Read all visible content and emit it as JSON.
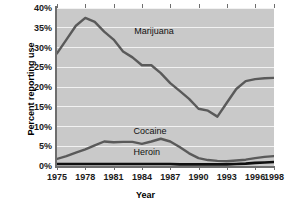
{
  "chart_data": {
    "type": "line",
    "title": "",
    "xlabel": "Year",
    "ylabel": "Percent reporting use",
    "xlim": [
      1975,
      1998
    ],
    "ylim": [
      0,
      40
    ],
    "grid": true,
    "legend_position": "inline-labels",
    "background_color": "#c9c9c9",
    "gridline_color": "#f2f2f2",
    "x_ticks": [
      1975,
      1978,
      1981,
      1984,
      1987,
      1990,
      1993,
      1996,
      1998
    ],
    "x_tick_labels": [
      "1975",
      "1978",
      "1981",
      "1984",
      "1987",
      "1990",
      "1993",
      "1996",
      "1998"
    ],
    "y_ticks": [
      0,
      5,
      10,
      15,
      20,
      25,
      30,
      35,
      40
    ],
    "y_tick_labels": [
      "0%",
      "5%",
      "10%",
      "15%",
      "20%",
      "25%",
      "30%",
      "35%",
      "40%"
    ],
    "x": [
      1975,
      1976,
      1977,
      1978,
      1979,
      1980,
      1981,
      1982,
      1983,
      1984,
      1985,
      1986,
      1987,
      1988,
      1989,
      1990,
      1991,
      1992,
      1993,
      1994,
      1995,
      1996,
      1997,
      1998
    ],
    "series": [
      {
        "name": "Marijuana",
        "color": "#5a5a5a",
        "label_x": 1983.2,
        "label_y": 34.0,
        "values": [
          28.5,
          32.0,
          35.5,
          37.5,
          36.5,
          34.0,
          32.0,
          29.0,
          27.5,
          25.5,
          25.5,
          23.5,
          21.0,
          19.0,
          17.0,
          14.5,
          14.0,
          12.5,
          16.0,
          19.5,
          21.5,
          22.0,
          22.2,
          22.3
        ]
      },
      {
        "name": "Cocaine",
        "color": "#5a5a5a",
        "label_x": 1983.1,
        "label_y": 8.6,
        "values": [
          1.8,
          2.5,
          3.4,
          4.2,
          5.2,
          6.2,
          6.0,
          6.1,
          6.1,
          5.6,
          6.2,
          6.9,
          6.2,
          4.8,
          3.2,
          2.0,
          1.5,
          1.3,
          1.2,
          1.4,
          1.6,
          2.0,
          2.3,
          2.5
        ]
      },
      {
        "name": "Heroin",
        "color": "#0f0f0f",
        "label_x": 1983.1,
        "label_y": 3.2,
        "values": [
          0.5,
          0.5,
          0.5,
          0.5,
          0.5,
          0.5,
          0.5,
          0.5,
          0.5,
          0.5,
          0.5,
          0.5,
          0.5,
          0.4,
          0.4,
          0.4,
          0.4,
          0.4,
          0.4,
          0.5,
          0.6,
          0.8,
          0.9,
          1.0
        ]
      }
    ]
  }
}
